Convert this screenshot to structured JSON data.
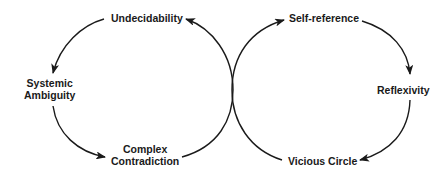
{
  "diagram": {
    "type": "two tangent cycles (figure-eight)",
    "left_cycle": {
      "nodes": [
        {
          "id": "undecidability",
          "line1": "Undecidability",
          "line2": ""
        },
        {
          "id": "systemic-ambiguity",
          "line1": "Systemic",
          "line2": "Ambiguity"
        },
        {
          "id": "complex-contradiction",
          "line1": "Complex",
          "line2": "Contradiction"
        }
      ],
      "edges": [
        [
          "Undecidability",
          "Systemic Ambiguity"
        ],
        [
          "Systemic Ambiguity",
          "Complex Contradiction"
        ],
        [
          "Complex Contradiction",
          "Undecidability"
        ]
      ]
    },
    "right_cycle": {
      "nodes": [
        {
          "id": "self-reference",
          "line1": "Self-reference",
          "line2": ""
        },
        {
          "id": "reflexivity",
          "line1": "Reflexivity",
          "line2": ""
        },
        {
          "id": "vicious-circle",
          "line1": "Vicious Circle",
          "line2": ""
        }
      ],
      "edges": [
        [
          "Self-reference",
          "Reflexivity"
        ],
        [
          "Reflexivity",
          "Vicious Circle"
        ],
        [
          "Vicious Circle",
          "Self-reference"
        ]
      ]
    },
    "colors": {
      "line": "#1a1a1a",
      "text": "#1a1a1a",
      "background": "#ffffff"
    }
  }
}
